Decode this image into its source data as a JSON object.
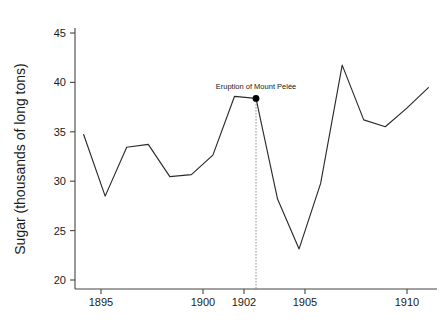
{
  "chart_data": {
    "type": "line",
    "title": "",
    "xlabel": "",
    "ylabel": "Sugar (thousands of long tons)",
    "x": [
      1894,
      1895,
      1896,
      1897,
      1898,
      1899,
      1900,
      1901,
      1902,
      1903,
      1904,
      1905,
      1906,
      1907,
      1908,
      1909,
      1910
    ],
    "values": [
      35.3,
      29.0,
      34.0,
      34.3,
      31.0,
      31.2,
      33.2,
      39.2,
      39.0,
      28.7,
      23.6,
      30.3,
      42.4,
      36.8,
      36.1,
      38.0,
      40.1
    ],
    "series": [
      {
        "name": "Sugar production",
        "values": [
          35.3,
          29.0,
          34.0,
          34.3,
          31.0,
          31.2,
          33.2,
          39.2,
          39.0,
          28.7,
          23.6,
          30.3,
          42.4,
          36.8,
          36.1,
          38.0,
          40.1
        ]
      }
    ],
    "xlim": [
      1893.6,
      1910.4
    ],
    "ylim": [
      19.5,
      46.2
    ],
    "xticks": [
      1895,
      1900,
      1902,
      1905,
      1910
    ],
    "xtick_labels": [
      "1895",
      "1900",
      "1902",
      "1905",
      "1910"
    ],
    "yticks": [
      20,
      25,
      30,
      35,
      40,
      45
    ],
    "ytick_labels": [
      "20",
      "25",
      "30",
      "35",
      "40",
      "45"
    ],
    "grid": false,
    "legend": "none",
    "line_color": "#2b2b2b",
    "annotations": [
      {
        "text": "Eruption of Mount Pelée",
        "x": 1902,
        "y": 39.0,
        "marker": "filled-circle",
        "guide": "vertical-dotted-to-axis"
      }
    ]
  },
  "axes": {
    "y_title": "Sugar (thousands of long tons)"
  }
}
